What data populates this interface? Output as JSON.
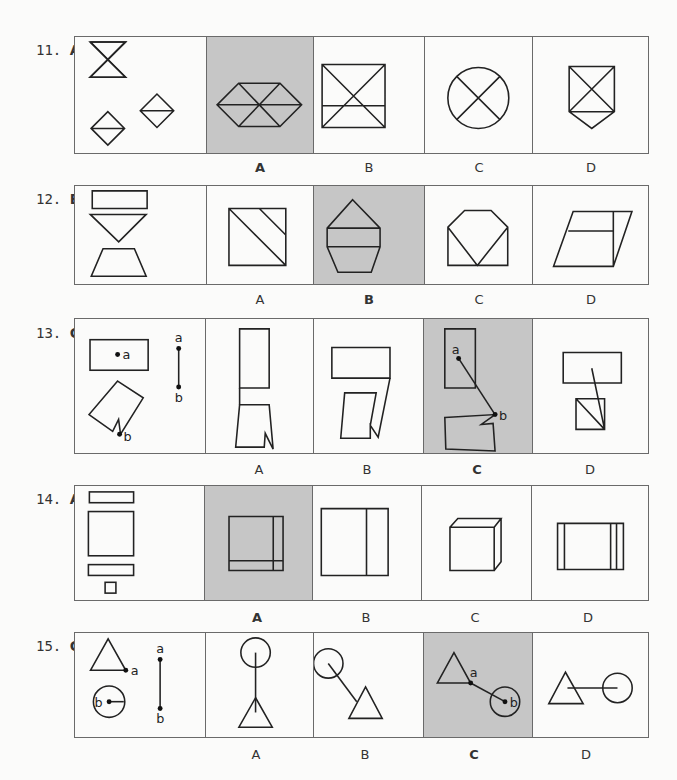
{
  "questions": [
    {
      "number": "11.",
      "answer": "A",
      "options": [
        "A",
        "B",
        "C",
        "D"
      ],
      "highlighted_option": "A",
      "figures": {
        "prompt": "hourglass-two-triangles-and-two-split-diamonds",
        "A": "hexagon-with-six-triangles",
        "B": "square-with-diagonals-and-horizontal-line",
        "C": "circle-with-x",
        "D": "pentagon-shield-with-x"
      }
    },
    {
      "number": "12.",
      "answer": "B",
      "options": [
        "A",
        "B",
        "C",
        "D"
      ],
      "highlighted_option": "B",
      "figures": {
        "prompt": "rectangle-inverted-triangle-trapezoid",
        "A": "square-with-two-diagonal-lines",
        "B": "house-pentagon-with-rectangle-and-trapezoid",
        "C": "octagon-top-with-v",
        "D": "parallelogram-with-lines"
      }
    },
    {
      "number": "13.",
      "answer": "C",
      "options": [
        "A",
        "B",
        "C",
        "D"
      ],
      "highlighted_option": "C",
      "point_labels": [
        "a",
        "b"
      ],
      "figures": {
        "prompt": "rectangle-with-point-a-notched-shape-with-point-b-and-segment-ab",
        "A": "stacked-rectangle-and-notched-shape",
        "B": "rectangle-and-notched-shape-joined",
        "C": "rectangle-and-notched-shape-with-segment-a-to-b",
        "D": "rectangle-and-square-with-line"
      }
    },
    {
      "number": "14.",
      "answer": "A",
      "options": [
        "A",
        "B",
        "C",
        "D"
      ],
      "highlighted_option": "A",
      "figures": {
        "prompt": "two-bars-square-and-small-square",
        "A": "square-with-vertical-and-horizontal-strip",
        "B": "square-with-vertical-line",
        "C": "cube",
        "D": "rectangle-with-three-vertical-lines"
      }
    },
    {
      "number": "15.",
      "answer": "C",
      "options": [
        "A",
        "B",
        "C",
        "D"
      ],
      "highlighted_option": "C",
      "point_labels": [
        "a",
        "b"
      ],
      "figures": {
        "prompt": "triangle-with-point-a-circle-with-point-b-and-segment-ab",
        "A": "circle-above-triangle-vertical-line",
        "B": "circle-and-triangle-diagonal-line",
        "C": "triangle-and-circle-joined-by-segment-a-b",
        "D": "triangle-and-circle-horizontal-line"
      }
    }
  ],
  "colors": {
    "highlight": "#c6c6c6",
    "border": "#6a6a6a",
    "stroke": "#222222",
    "background": "#fbfbfa"
  }
}
